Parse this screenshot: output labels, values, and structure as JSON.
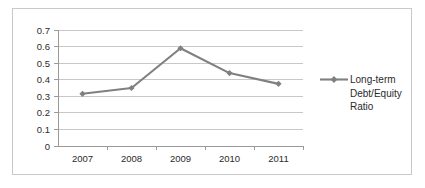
{
  "chart_data": {
    "type": "line",
    "title": "",
    "xlabel": "",
    "ylabel": "",
    "categories": [
      "2007",
      "2008",
      "2009",
      "2010",
      "2011"
    ],
    "series": [
      {
        "name": "Long-term Debt/Equity Ratio",
        "values": [
          0.315,
          0.35,
          0.59,
          0.44,
          0.375
        ]
      }
    ],
    "ylim": [
      0,
      0.7
    ],
    "ytick_labels": [
      "0",
      "0.1",
      "0.2",
      "0.3",
      "0.4",
      "0.5",
      "0.6",
      "0.7"
    ],
    "ytick_values": [
      0,
      0.1,
      0.2,
      0.3,
      0.4,
      0.5,
      0.6,
      0.7
    ],
    "grid": true,
    "legend_position": "right",
    "legend_lines": [
      "Long-term",
      "Debt/Equity",
      "Ratio"
    ],
    "series_color": "#808080",
    "grid_color": "#c8c8c8",
    "axis_color": "#9a9a9a",
    "background_color": "#ffffff",
    "border_color": "#c9c9c9",
    "marker": "diamond"
  },
  "ticks": {
    "y": {
      "t0": "0.7",
      "t1": "0.6",
      "t2": "0.5",
      "t3": "0.4",
      "t4": "0.3",
      "t5": "0.2",
      "t6": "0.1",
      "t7": "0"
    },
    "x": {
      "c0": "2007",
      "c1": "2008",
      "c2": "2009",
      "c3": "2010",
      "c4": "2011"
    }
  },
  "legend": {
    "line1": "Long-term",
    "line2": "Debt/Equity",
    "line3": "Ratio"
  }
}
